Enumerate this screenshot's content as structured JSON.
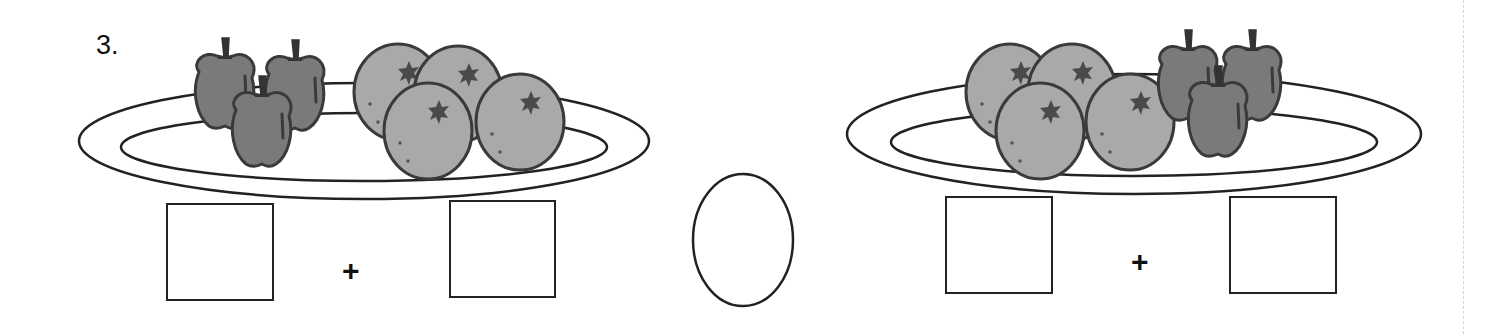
{
  "problem": {
    "number_label": "3.",
    "left_plate": {
      "fruits": [
        {
          "type": "apple",
          "count": 3
        },
        {
          "type": "orange",
          "count": 4
        }
      ],
      "answer_boxes": [
        "",
        ""
      ],
      "operator": "+"
    },
    "comparison_circle": "",
    "right_plate": {
      "fruits": [
        {
          "type": "orange",
          "count": 4
        },
        {
          "type": "apple",
          "count": 3
        }
      ],
      "answer_boxes": [
        "",
        ""
      ],
      "operator": "+"
    }
  },
  "colors": {
    "line": "#222222",
    "apple_fill": "#7a7a7a",
    "orange_fill": "#a9a9a9",
    "outline": "#3a3a3a",
    "background": "#ffffff"
  }
}
